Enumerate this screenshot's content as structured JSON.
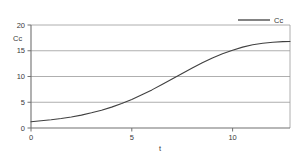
{
  "chart_data": {
    "type": "line",
    "title": "",
    "subtitle": "",
    "xlabel": "t",
    "ylabel": "Cc",
    "xlim": [
      0,
      12.85
    ],
    "ylim": [
      0,
      20
    ],
    "xticks": [
      0,
      5,
      10
    ],
    "xtick_labels": [
      "0",
      "5",
      "10"
    ],
    "yticks": [
      0,
      5,
      10,
      15,
      20
    ],
    "ytick_labels": [
      "0",
      "5",
      "10",
      "15",
      "20"
    ],
    "grid": "horizontal",
    "legend_position": "top-right",
    "line_color": "#404040",
    "grid_color": "#9a9a9a",
    "axis_color": "#808080",
    "series": [
      {
        "name": "Cc",
        "x": [
          0,
          0.5,
          1,
          1.5,
          2,
          2.5,
          3,
          3.5,
          4,
          4.5,
          5,
          5.5,
          6,
          6.5,
          7,
          7.5,
          8,
          8.5,
          9,
          9.5,
          10,
          10.5,
          11,
          11.5,
          12,
          12.5,
          12.85
        ],
        "values": [
          1.2,
          1.4,
          1.6,
          1.85,
          2.15,
          2.5,
          2.95,
          3.45,
          4.05,
          4.75,
          5.55,
          6.45,
          7.4,
          8.45,
          9.5,
          10.6,
          11.65,
          12.65,
          13.6,
          14.4,
          15.1,
          15.7,
          16.15,
          16.45,
          16.65,
          16.78,
          16.8
        ]
      }
    ],
    "legend": [
      {
        "label": "Cc",
        "color": "#404040"
      }
    ]
  },
  "axes": {
    "y_axis_title": "Cc",
    "x_axis_title": "t"
  },
  "legend_entry_label": "Cc"
}
